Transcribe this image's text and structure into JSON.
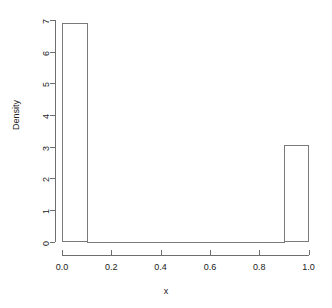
{
  "chart_data": {
    "type": "bar",
    "title": "",
    "subtitle": "",
    "xlabel": "x",
    "ylabel": "Density",
    "xlim": [
      0.0,
      1.0
    ],
    "ylim": [
      0,
      7
    ],
    "grid": false,
    "legend": null,
    "bin_width": 0.1,
    "bin_edges": [
      0.0,
      0.1,
      0.2,
      0.3,
      0.4,
      0.5,
      0.6,
      0.7,
      0.8,
      0.9,
      1.0
    ],
    "categories": [
      "0.0-0.1",
      "0.1-0.2",
      "0.2-0.3",
      "0.3-0.4",
      "0.4-0.5",
      "0.5-0.6",
      "0.6-0.7",
      "0.7-0.8",
      "0.8-0.9",
      "0.9-1.0"
    ],
    "values": [
      6.9,
      0,
      0,
      0,
      0,
      0,
      0,
      0,
      0,
      3.05
    ],
    "xticks": [
      0.0,
      0.2,
      0.4,
      0.6,
      0.8,
      1.0
    ],
    "xtick_labels": [
      "0.0",
      "0.2",
      "0.4",
      "0.6",
      "0.8",
      "1.0"
    ],
    "yticks": [
      0,
      1,
      2,
      3,
      4,
      5,
      6,
      7
    ],
    "ytick_labels": [
      "0",
      "1",
      "2",
      "3",
      "4",
      "5",
      "6",
      "7"
    ],
    "bar_fill": "#ffffff",
    "bar_stroke": "#7a7a7a",
    "axis_color": "#6e6e6e",
    "background": "#ffffff"
  }
}
